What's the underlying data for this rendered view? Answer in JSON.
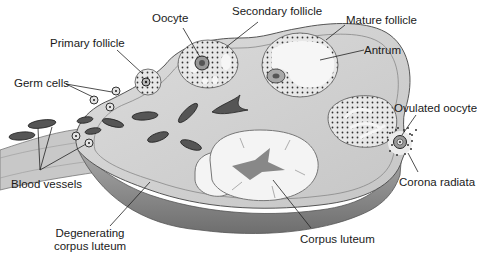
{
  "labels": {
    "oocyte": "Oocyte",
    "secondary_follicle": "Secondary follicle",
    "mature_follicle": "Mature follicle",
    "antrum": "Antrum",
    "primary_follicle": "Primary follicle",
    "germ_cells": "Germ cells",
    "ovulated_oocyte": "Ovulated oocyte",
    "blood_vessels": "Blood vessels",
    "corona_radiata": "Corona radiata",
    "degenerating_corpus_luteum_line1": "Degenerating",
    "degenerating_corpus_luteum_line2": "corpus luteum",
    "corpus_luteum": "Corpus luteum"
  },
  "colors": {
    "stroma": "#d4d4d4",
    "cortex_edge": "#9a9a9a",
    "underside": "#8a8a8a",
    "follicle_fill": "#e6e6e6",
    "antrum": "#f6f6f6",
    "vessel": "#4a4a4a",
    "text": "#1a1a1a"
  }
}
